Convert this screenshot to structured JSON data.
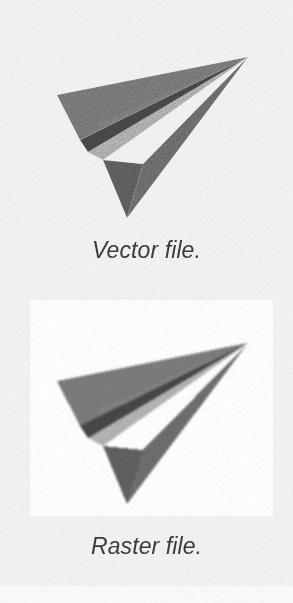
{
  "page": {
    "background_color": "#f3f3f3",
    "width": 293,
    "height": 603
  },
  "figure": {
    "title": "",
    "panels": [
      {
        "id": "vector",
        "caption": "Vector file.",
        "artwork": "paper-plane-icon",
        "rendering": "sharp vector edges",
        "card_background": "#f3f3f3"
      },
      {
        "id": "raster",
        "caption": "Raster file.",
        "artwork": "paper-plane-icon",
        "rendering": "pixelated blurred bitmap",
        "card_background": "#ffffff"
      }
    ]
  },
  "artwork": {
    "name": "paper-plane-icon",
    "description": "Grey origami paper airplane pointing to the upper right",
    "facets": {
      "upper_wing": "#8d8d8d",
      "crease_shadow": "#545454",
      "inner_highlight": "#c9c9c9",
      "lower_wing": "#7f7f7f",
      "tail_fin": "#6f6f6f",
      "nose_edge": "#9a9a9a"
    }
  },
  "captions": {
    "vector": "Vector file.",
    "raster": "Raster file."
  },
  "colors": {
    "paper": "#f3f3f3",
    "card": "#ffffff",
    "text": "#3b3b3b"
  }
}
